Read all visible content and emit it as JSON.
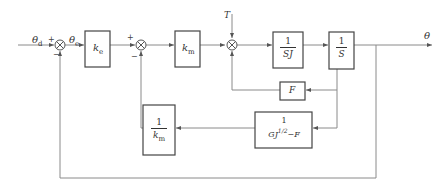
{
  "diagram": {
    "type": "control block diagram",
    "signals": {
      "input": "θ",
      "input_sub": "d",
      "error": "θ",
      "error_sub": "e",
      "disturbance": "T",
      "output": "θ"
    },
    "blocks": {
      "ke": {
        "main": "k",
        "sub": "e"
      },
      "km": {
        "main": "k",
        "sub": "m"
      },
      "inv_sj": {
        "num": "1",
        "den": "SJ"
      },
      "inv_s": {
        "num": "1",
        "den": "S"
      },
      "f": {
        "label": "F"
      },
      "inv_km": {
        "num": "1",
        "den_main": "k",
        "den_sub": "m"
      },
      "gj": {
        "num": "1",
        "den": "GJ",
        "den_sup": "1/2",
        "den_tail": "−F"
      }
    },
    "signs": {
      "sum1_plus": "+",
      "sum1_minus": "−",
      "sum2_plus": "+",
      "sum2_minus": "−"
    },
    "colors": {
      "line": "#888888",
      "box": "#444444",
      "text": "#333333"
    }
  }
}
